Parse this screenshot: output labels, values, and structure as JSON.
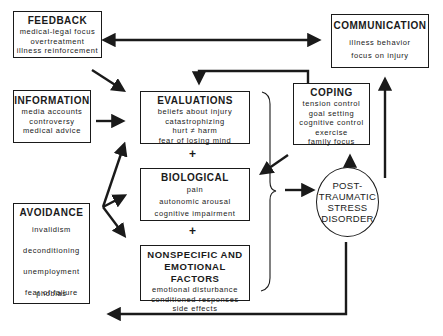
{
  "diagram": {
    "nodes": {
      "feedback": {
        "title": "FEEDBACK",
        "items": [
          "medical-legal focus",
          "overtreatment",
          "illness reinforcement"
        ]
      },
      "communication": {
        "title": "COMMUNICATION",
        "items": [
          "illness behavior",
          "focus on injury"
        ]
      },
      "information": {
        "title": "INFORMATION",
        "items": [
          "media accounts",
          "controversy",
          "medical advice"
        ]
      },
      "evaluations": {
        "title": "EVALUATIONS",
        "items": [
          "beliefs about injury",
          "catastrophizing",
          "hurt ≠ harm",
          "fear of losing mind"
        ]
      },
      "coping": {
        "title": "COPING",
        "items": [
          "tension control",
          "goal setting",
          "cognitive control",
          "exercise",
          "family focus"
        ]
      },
      "biological": {
        "title": "BIOLOGICAL",
        "items": [
          "pain",
          "autonomic arousal",
          "cognitive impairment"
        ]
      },
      "nonspecific": {
        "title_line1": "NONSPECIFIC AND",
        "title_line2": "EMOTIONAL FACTORS",
        "items": [
          "emotional disturbance",
          "conditioned responses",
          "side effects"
        ]
      },
      "avoidance": {
        "title": "AVOIDANCE",
        "items": [
          "invalidism",
          "deconditioning",
          "unemployment",
          "fear of failure",
          "phobias"
        ]
      },
      "ptsd": {
        "lines": [
          "POST-",
          "TRAUMATIC",
          "STRESS",
          "DISORDER"
        ]
      }
    },
    "operators": {
      "plus": "+"
    }
  }
}
